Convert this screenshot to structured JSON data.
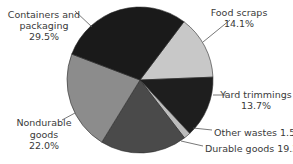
{
  "chart_data": {
    "type": "pie",
    "title": "",
    "start_angle_deg_clockwise_from_top": 37,
    "slices": [
      {
        "label": "Food scraps",
        "value": 14.1,
        "display": "14.1%",
        "color": "#c8c8c8"
      },
      {
        "label": "Yard trimmings",
        "value": 13.7,
        "display": "13.7%",
        "color": "#1e1e1e"
      },
      {
        "label": "Other wastes",
        "value": 1.5,
        "display": "1.5%",
        "color": "#bcbcbc"
      },
      {
        "label": "Durable goods",
        "value": 19.2,
        "display": "19.2%",
        "color": "#4a4a4a"
      },
      {
        "label": "Nondurable goods",
        "value": 22.0,
        "display": "22.0%",
        "color": "#8c8c8c"
      },
      {
        "label": "Containers and packaging",
        "value": 29.5,
        "display": "29.5%",
        "color": "#1a1a1a"
      }
    ],
    "categories": [
      "Food scraps",
      "Yard trimmings",
      "Other wastes",
      "Durable goods",
      "Nondurable goods",
      "Containers and packaging"
    ],
    "values": [
      14.1,
      13.7,
      1.5,
      19.2,
      22.0,
      29.5
    ],
    "legend": "none (callout labels)"
  },
  "labels": {
    "containers": {
      "line1": "Containers and",
      "line2": "packaging",
      "line3": "29.5%"
    },
    "food": {
      "line1": "Food scraps",
      "line2": "14.1%"
    },
    "yard": {
      "line1": "Yard trimmings",
      "line2": "13.7%"
    },
    "other": {
      "line1": "Other wastes 1.5%"
    },
    "durable": {
      "line1": "Durable goods 19.2%"
    },
    "nondurable": {
      "line1": "Nondurable",
      "line2": "goods",
      "line3": "22.0%"
    }
  }
}
